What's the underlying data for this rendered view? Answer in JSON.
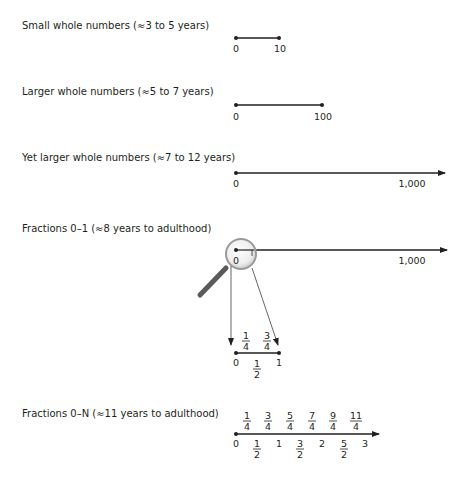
{
  "rows": [
    {
      "label": "Small whole numbers (≈3 to 5 years)",
      "start": "0",
      "end": "10"
    },
    {
      "label": "Larger whole numbers (≈5 to 7 years)",
      "start": "0",
      "end": "100"
    },
    {
      "label": "Yet larger whole numbers (≈7 to 12 years)",
      "start": "0",
      "end": "1,000"
    },
    {
      "label": "Fractions 0–1 (≈8 years to adulthood)",
      "start": "0",
      "end": "1,000",
      "zoom_line": {
        "start": "0",
        "end": "1",
        "mid_below": {
          "num": "1",
          "den": "2"
        },
        "above": [
          {
            "num": "1",
            "den": "4"
          },
          {
            "num": "3",
            "den": "4"
          }
        ]
      }
    },
    {
      "label": "Fractions 0–N (≈11 years to adulthood)",
      "below": [
        "0",
        "1",
        "2",
        "3"
      ],
      "below_fracs": [
        {
          "num": "1",
          "den": "2"
        },
        {
          "num": "3",
          "den": "2"
        },
        {
          "num": "5",
          "den": "2"
        }
      ],
      "above": [
        {
          "num": "1",
          "den": "4"
        },
        {
          "num": "3",
          "den": "4"
        },
        {
          "num": "5",
          "den": "4"
        },
        {
          "num": "7",
          "den": "4"
        },
        {
          "num": "9",
          "den": "4"
        },
        {
          "num": "11",
          "den": "4"
        }
      ]
    }
  ],
  "colors": {
    "ink": "#231f20",
    "magnifier_handle": "#5a5a5a",
    "lens": "#e6e6e6"
  }
}
